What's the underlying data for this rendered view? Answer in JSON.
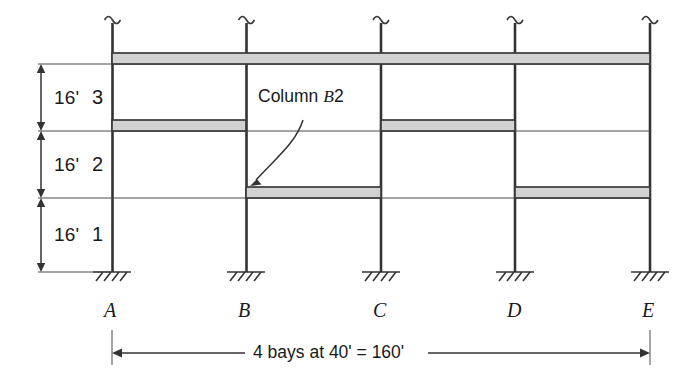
{
  "figure": {
    "name": "three-story-four-bay-moment-frame-elevation",
    "colors": {
      "line": "#333333",
      "beam_fill": "#d2d2d2",
      "beam_edge": "#3a3a3a",
      "thin_line": "#4a4a4a",
      "background": "#ffffff"
    }
  },
  "annotation": {
    "callout_prefix": "Column ",
    "callout_grid": "B",
    "callout_level": "2",
    "callout_full": "Column B2"
  },
  "stories": [
    {
      "number": "3",
      "height": "16'"
    },
    {
      "number": "2",
      "height": "16'"
    },
    {
      "number": "1",
      "height": "16'"
    }
  ],
  "grid_lines": [
    {
      "label": "A",
      "x": 112
    },
    {
      "label": "B",
      "x": 246
    },
    {
      "label": "C",
      "x": 381
    },
    {
      "label": "D",
      "x": 515
    },
    {
      "label": "E",
      "x": 650
    }
  ],
  "levels": [
    {
      "name": "roof",
      "y": 64
    },
    {
      "name": "level-3",
      "y": 131
    },
    {
      "name": "level-2",
      "y": 198
    },
    {
      "name": "ground",
      "y": 272
    }
  ],
  "beams": [
    {
      "level": "roof",
      "from": "A",
      "to": "E"
    },
    {
      "level": "level-3",
      "from": "A",
      "to": "B"
    },
    {
      "level": "level-3",
      "from": "C",
      "to": "D"
    },
    {
      "level": "level-2",
      "from": "B",
      "to": "C"
    },
    {
      "level": "level-2",
      "from": "D",
      "to": "E"
    }
  ],
  "bay_dimension": {
    "text": "4 bays at 40' = 160'",
    "bays": "4",
    "bay_width": "40'",
    "total": "160'"
  },
  "supports": {
    "type": "fixed-base",
    "count": 5
  }
}
